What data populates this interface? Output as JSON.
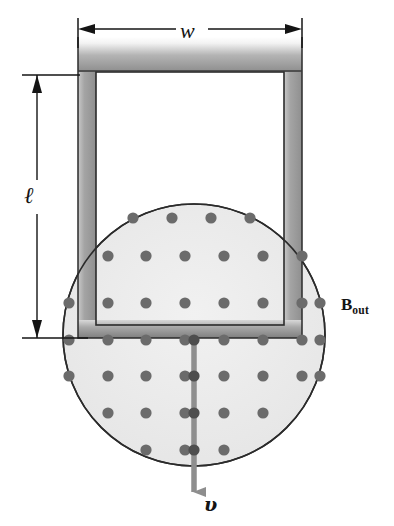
{
  "figure": {
    "background_color": "#ffffff",
    "width": 394,
    "height": 526
  },
  "labels": {
    "width_label": "w",
    "length_label": "ℓ",
    "field_label_base": "B",
    "field_label_subscript": "out",
    "velocity_label": "υ"
  },
  "colors": {
    "ink": "#141414",
    "field_region_fill": "#ededed",
    "field_dot": "#6b6b6b",
    "loop_bar_gray": "#9a9a9a",
    "loop_edge_dark": "#4a4a4a",
    "velocity_arrow": "#8e8e8e",
    "dimension_line": "#1a1a1a"
  },
  "field_region": {
    "shape": "circle",
    "center_x": 194,
    "center_y": 335,
    "radius": 131,
    "direction": "out of page",
    "marker": "dot"
  },
  "field_dots": {
    "radius": 5.6,
    "rows": [
      {
        "y": 218,
        "xs": [
          133,
          172,
          211,
          250
        ]
      },
      {
        "y": 256,
        "xs": [
          108,
          146,
          185,
          224,
          263,
          302
        ]
      },
      {
        "y": 303,
        "xs": [
          69,
          108,
          146,
          185,
          224,
          263,
          302,
          320
        ]
      },
      {
        "y": 340,
        "xs": [
          69,
          108,
          146,
          185,
          224,
          263,
          302,
          320
        ]
      },
      {
        "y": 376,
        "xs": [
          69,
          108,
          146,
          185,
          224,
          263,
          302,
          320
        ]
      },
      {
        "y": 413,
        "xs": [
          108,
          146,
          185,
          224,
          263
        ]
      },
      {
        "y": 450,
        "xs": [
          146,
          185,
          224
        ]
      }
    ]
  },
  "loop": {
    "type": "u-shaped-conducting-loop",
    "outer_left": 78,
    "outer_right": 302,
    "outer_top": 37,
    "outer_bottom": 338,
    "inner_left": 96,
    "inner_right": 284,
    "inner_top": 72,
    "inner_bottom": 325,
    "bar_thickness": 18
  },
  "dimensions": {
    "width": {
      "label": "w",
      "y": 29,
      "x_start": 78,
      "x_end": 302,
      "arrow_both_ends": true
    },
    "length": {
      "label": "ℓ",
      "x": 37,
      "y_start": 75,
      "y_end": 338,
      "arrow_both_ends": true
    }
  },
  "velocity_arrow": {
    "label": "υ",
    "x": 194,
    "y_start": 338,
    "y_end": 505,
    "direction": "down",
    "color": "#8e8e8e"
  }
}
